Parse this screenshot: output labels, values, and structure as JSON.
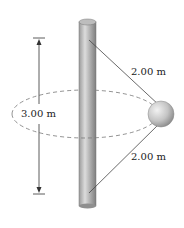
{
  "diagram": {
    "labels": {
      "height": "3.00 m",
      "upper_string": "2.00 m",
      "lower_string": "2.00 m"
    },
    "colors": {
      "pole_light": "#d6d6d6",
      "pole_dark": "#8a8a8a",
      "line": "#444444",
      "dashed": "#777777"
    }
  }
}
